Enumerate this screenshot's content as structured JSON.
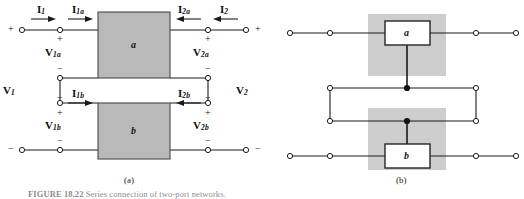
{
  "figure": {
    "caption_prefix": "FIGURE 18.22",
    "caption_text": "Series connection of two-port networks.",
    "panels": [
      {
        "id": "a",
        "label": "(a)"
      },
      {
        "id": "b",
        "label": "(b)"
      }
    ]
  },
  "panel_a": {
    "blocks": [
      {
        "name": "block-a",
        "letter": "a"
      },
      {
        "name": "block-b",
        "letter": "b"
      }
    ],
    "currents": [
      {
        "name": "current-i1",
        "base": "I",
        "sub": "1",
        "direction": "right"
      },
      {
        "name": "current-i1a",
        "base": "I",
        "sub": "1a",
        "direction": "right"
      },
      {
        "name": "current-i2a",
        "base": "I",
        "sub": "2a",
        "direction": "left"
      },
      {
        "name": "current-i2",
        "base": "I",
        "sub": "2",
        "direction": "left"
      },
      {
        "name": "current-i1b",
        "base": "I",
        "sub": "1b",
        "direction": "right"
      },
      {
        "name": "current-i2b",
        "base": "I",
        "sub": "2b",
        "direction": "left"
      }
    ],
    "voltages": [
      {
        "name": "voltage-v1",
        "base": "V",
        "sub": "1"
      },
      {
        "name": "voltage-v2",
        "base": "V",
        "sub": "2"
      },
      {
        "name": "voltage-v1a",
        "base": "V",
        "sub": "1a"
      },
      {
        "name": "voltage-v2a",
        "base": "V",
        "sub": "2a"
      },
      {
        "name": "voltage-v1b",
        "base": "V",
        "sub": "1b"
      },
      {
        "name": "voltage-v2b",
        "base": "V",
        "sub": "2b"
      }
    ],
    "polarity": {
      "plus": "+",
      "minus": "−"
    }
  },
  "panel_b": {
    "blocks": [
      {
        "name": "block-a",
        "letter": "a"
      },
      {
        "name": "block-b",
        "letter": "b"
      }
    ]
  },
  "colors": {
    "wire": "#1a1a1a",
    "block_fill": "#b9b9b9",
    "block_stroke": "#4a4a4a",
    "shade_fill": "#cdcdcd",
    "inner_box_fill": "#ffffff",
    "inner_box_stroke": "#262626",
    "terminal_fill": "#ffffff",
    "junction_fill": "#141414",
    "text": "#101010",
    "background": "#ffffff"
  }
}
